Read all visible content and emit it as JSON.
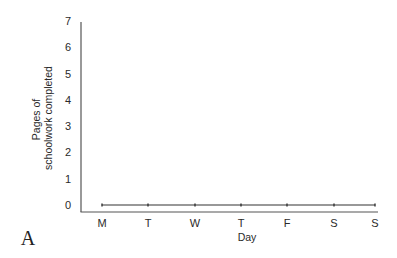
{
  "panel_label": "A",
  "chart_data": {
    "type": "line",
    "title": "",
    "xlabel": "Day",
    "ylabel_lines": [
      "Pages of",
      "schoolwork completed"
    ],
    "ylabel": "Pages of schoolwork completed",
    "categories": [
      "M",
      "T",
      "W",
      "T",
      "F",
      "S",
      "S"
    ],
    "series": [
      {
        "name": "Pages completed",
        "values": [
          0,
          0,
          0,
          0,
          0,
          0,
          0
        ]
      }
    ],
    "ylim": [
      0,
      7
    ],
    "yticks": [
      0,
      1,
      2,
      3,
      4,
      5,
      6,
      7
    ],
    "grid": false,
    "legend": null,
    "colors": {
      "axis": "#555555",
      "line": "#333333",
      "text": "#2a2a2a"
    }
  }
}
